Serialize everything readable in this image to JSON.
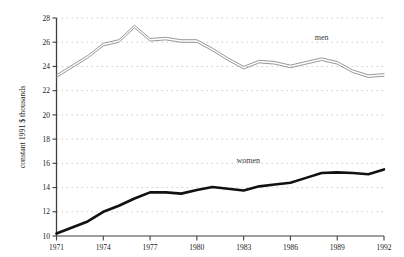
{
  "chart_data": {
    "type": "line",
    "title": "",
    "xlabel": "",
    "ylabel": "constant 1991 $ thousands",
    "xlim": [
      1971,
      1992
    ],
    "ylim": [
      10,
      28
    ],
    "grid": true,
    "grid_style": "dotted-horizontal",
    "legend_position": "inline-annotation",
    "x": [
      1971,
      1972,
      1973,
      1974,
      1975,
      1976,
      1977,
      1978,
      1979,
      1980,
      1981,
      1982,
      1983,
      1984,
      1985,
      1986,
      1987,
      1988,
      1989,
      1990,
      1991,
      1992
    ],
    "xticks": [
      1971,
      1974,
      1977,
      1980,
      1983,
      1986,
      1989,
      1992
    ],
    "xtick_labels": [
      "1971",
      "1974",
      "1977",
      "1980",
      "1983",
      "1986",
      "1989",
      "1992"
    ],
    "yticks": [
      10,
      12,
      14,
      16,
      18,
      20,
      22,
      24,
      26,
      28
    ],
    "ytick_labels": [
      "10",
      "12",
      "14",
      "16",
      "18",
      "20",
      "22",
      "24",
      "26",
      "28"
    ],
    "series": [
      {
        "name": "men",
        "color": "#8c8c8c",
        "style": "double-stroke-outline",
        "label_text": "men",
        "label_x": 1988.0,
        "label_y": 26.2,
        "values": [
          23.2,
          24.0,
          24.8,
          25.8,
          26.1,
          27.3,
          26.2,
          26.3,
          26.1,
          26.1,
          25.4,
          24.6,
          23.9,
          24.4,
          24.3,
          24.0,
          24.3,
          24.6,
          24.3,
          23.6,
          23.2,
          23.3
        ]
      },
      {
        "name": "women",
        "color": "#111111",
        "style": "thick-solid",
        "label_text": "women",
        "label_x": 1983.3,
        "label_y": 16.0,
        "values": [
          10.2,
          10.7,
          11.2,
          12.0,
          12.5,
          13.1,
          13.6,
          13.6,
          13.5,
          13.8,
          14.05,
          13.9,
          13.75,
          14.1,
          14.25,
          14.4,
          14.8,
          15.2,
          15.25,
          15.2,
          15.1,
          15.5
        ]
      }
    ]
  },
  "colors": {
    "background": "#ffffff",
    "axis": "#3f3f3f",
    "grid": "#b9b9b9",
    "men_line": "#8c8c8c",
    "women_line": "#111111",
    "text": "#1a1a1a"
  },
  "axes": {
    "y_title": "constant 1991 $ thousands"
  }
}
